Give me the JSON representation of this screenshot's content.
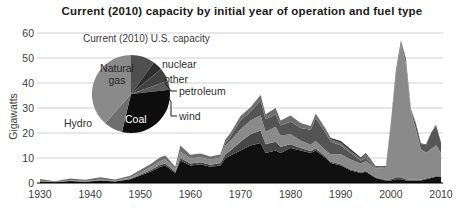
{
  "chart": {
    "title": "Current (2010) capacity by initial year of operation and fuel type",
    "ylabel": "Gigawatts"
  },
  "style": {
    "background": "#ffffff",
    "grid_color": "#cfcfcf",
    "axis_color": "#000000",
    "text_color": "#3d3d3d",
    "title_color": "#1a1a1a",
    "leader_line_color": "#1a1a1a"
  },
  "chart_data": {
    "type": "area",
    "stacked": true,
    "title": "Current (2010) capacity by initial year of operation and fuel type",
    "xlabel": "",
    "ylabel": "Gigawatts",
    "xlim": [
      1930,
      2010
    ],
    "ylim": [
      0,
      60
    ],
    "yticks": [
      0,
      10,
      20,
      30,
      40,
      50,
      60
    ],
    "xticks": [
      1930,
      1940,
      1950,
      1960,
      1970,
      1980,
      1990,
      2000,
      2010
    ],
    "grid": true,
    "legend_position": "none",
    "x": [
      1930,
      1933,
      1936,
      1939,
      1942,
      1945,
      1948,
      1950,
      1952,
      1954,
      1955,
      1957,
      1958,
      1960,
      1962,
      1964,
      1966,
      1967,
      1968,
      1970,
      1972,
      1974,
      1975,
      1977,
      1978,
      1980,
      1982,
      1984,
      1985,
      1987,
      1988,
      1990,
      1992,
      1994,
      1995,
      1997,
      1999,
      2000,
      2001,
      2002,
      2003,
      2004,
      2005,
      2006,
      2007,
      2008,
      2009,
      2010
    ],
    "series": [
      {
        "name": "Coal",
        "color": "#101010",
        "values": [
          0.6,
          0.3,
          0.8,
          0.5,
          1.0,
          0.6,
          1.5,
          3.0,
          4.5,
          6.5,
          7.0,
          4.0,
          9.0,
          7.0,
          7.5,
          6.5,
          7.0,
          10.0,
          11.0,
          13.0,
          15.0,
          16.0,
          12.0,
          13.0,
          12.0,
          14.0,
          13.0,
          12.0,
          13.0,
          10.0,
          8.0,
          7.0,
          5.0,
          4.0,
          4.5,
          2.0,
          1.0,
          1.0,
          1.5,
          1.5,
          1.0,
          1.0,
          1.0,
          1.0,
          1.5,
          2.0,
          2.5,
          2.5
        ]
      },
      {
        "name": "Petroleum",
        "color": "#474747",
        "values": [
          0.1,
          0.0,
          0.1,
          0.1,
          0.1,
          0.1,
          0.2,
          0.4,
          0.6,
          0.8,
          0.8,
          0.5,
          1.0,
          0.8,
          0.8,
          0.8,
          1.0,
          1.5,
          2.0,
          3.5,
          4.5,
          5.0,
          3.5,
          3.5,
          2.5,
          1.5,
          1.0,
          0.8,
          0.8,
          0.6,
          0.5,
          0.5,
          0.4,
          0.3,
          0.3,
          0.2,
          0.2,
          0.5,
          0.8,
          0.8,
          0.5,
          0.3,
          0.3,
          0.3,
          0.3,
          0.3,
          0.3,
          0.2
        ]
      },
      {
        "name": "Natural gas",
        "color": "#8a8a8a",
        "values": [
          0.2,
          0.1,
          0.2,
          0.2,
          0.3,
          0.2,
          0.5,
          0.8,
          1.2,
          1.5,
          1.7,
          1.0,
          2.5,
          2.0,
          2.0,
          2.0,
          2.2,
          3.5,
          4.0,
          5.0,
          5.5,
          6.0,
          5.0,
          6.0,
          4.5,
          4.0,
          3.0,
          2.5,
          3.0,
          2.5,
          3.0,
          4.0,
          4.0,
          3.5,
          4.0,
          3.5,
          4.5,
          22.0,
          41.0,
          53.0,
          46.0,
          27.0,
          20.0,
          12.0,
          10.0,
          11.0,
          12.0,
          9.0
        ]
      },
      {
        "name": "Nuclear",
        "color": "#545454",
        "values": [
          0,
          0,
          0,
          0,
          0,
          0,
          0,
          0,
          0,
          0,
          0,
          0,
          0,
          0,
          0,
          0,
          0,
          1.0,
          1.5,
          3.5,
          3.5,
          6.0,
          5.0,
          5.0,
          4.0,
          5.0,
          5.0,
          6.0,
          9.0,
          7.0,
          5.0,
          3.5,
          2.5,
          1.2,
          1.2,
          0.1,
          0,
          0,
          0,
          0,
          0,
          0,
          0,
          0,
          0,
          0,
          0,
          0
        ]
      },
      {
        "name": "Hydro",
        "color": "#6e6e6e",
        "values": [
          0.7,
          0.3,
          0.7,
          0.5,
          0.9,
          0.5,
          0.7,
          1.0,
          1.2,
          1.5,
          1.5,
          1.0,
          2.5,
          1.5,
          1.5,
          1.3,
          1.2,
          1.5,
          1.5,
          1.8,
          1.8,
          2.2,
          2.0,
          2.5,
          2.0,
          2.5,
          2.0,
          1.5,
          2.0,
          1.2,
          1.0,
          1.0,
          0.8,
          0.7,
          1.5,
          0.6,
          0.4,
          0.3,
          0.3,
          0.4,
          0.5,
          0.4,
          0.3,
          0.3,
          0.3,
          0.3,
          0.4,
          0.3
        ]
      },
      {
        "name": "Wind",
        "color": "#565656",
        "values": [
          0,
          0,
          0,
          0,
          0,
          0,
          0,
          0,
          0,
          0,
          0,
          0,
          0,
          0,
          0,
          0,
          0,
          0,
          0,
          0,
          0,
          0,
          0,
          0,
          0,
          0,
          0,
          0,
          0,
          0,
          0,
          0,
          0,
          0,
          0,
          0,
          0.3,
          0.3,
          1.0,
          0.8,
          1.5,
          0.5,
          2.0,
          2.0,
          3.0,
          6.0,
          7.5,
          4.0
        ]
      },
      {
        "name": "Other",
        "color": "#303030",
        "values": [
          0,
          0,
          0,
          0,
          0,
          0,
          0,
          0,
          0,
          0,
          0,
          0,
          0,
          0,
          0,
          0,
          0,
          0,
          0,
          0,
          0,
          0,
          0,
          0,
          0,
          0,
          0,
          0,
          0,
          0.3,
          0.5,
          0.8,
          0.8,
          0.5,
          0.5,
          0.3,
          0.3,
          0.3,
          0.4,
          0.4,
          0.3,
          0.3,
          0.3,
          0.3,
          0.3,
          0.4,
          0.5,
          0.3
        ]
      }
    ]
  },
  "pie": {
    "title": "Current (2010) U.S. capacity",
    "center": {
      "cx": 131,
      "cy": 94,
      "r": 39
    },
    "slices": [
      {
        "label": "nuclear",
        "pct": 10.0,
        "color": "#4f4f4f"
      },
      {
        "label": "other",
        "pct": 4.0,
        "color": "#2e2e2e"
      },
      {
        "label": "petroleum",
        "pct": 5.5,
        "color": "#424242"
      },
      {
        "label": "wind",
        "pct": 3.8,
        "color": "#5a5a5a"
      },
      {
        "label": "Coal",
        "pct": 30.4,
        "color": "#0d0d0d"
      },
      {
        "label": "Hydro",
        "pct": 7.8,
        "color": "#6e6e6e"
      },
      {
        "label": "Natural gas",
        "pct": 38.5,
        "color": "#8a8a8a"
      }
    ],
    "labels": {
      "natural_gas_line1": "Natural",
      "natural_gas_line2": "gas",
      "coal": "Coal",
      "hydro": "Hydro",
      "nuclear": "nuclear",
      "other": "other",
      "petroleum": "petroleum",
      "wind": "wind"
    }
  }
}
